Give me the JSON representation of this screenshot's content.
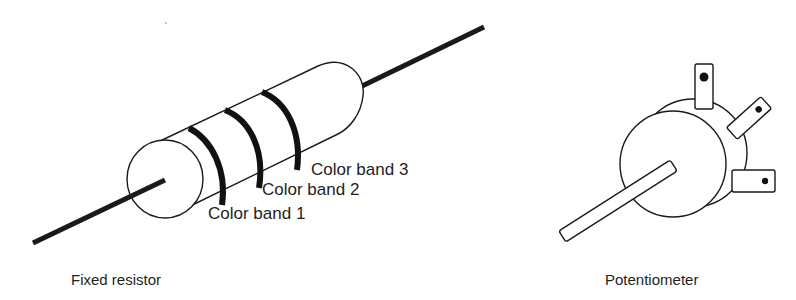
{
  "figures": [
    {
      "id": "fixed-resistor",
      "caption": "Fixed resistor",
      "labels": [
        "Color band 1",
        "Color band 2",
        "Color band 3"
      ]
    },
    {
      "id": "potentiometer",
      "caption": "Potentiometer",
      "terminals": 3
    }
  ],
  "colors": {
    "stroke": "#1a1a1a",
    "fill": "#ffffff",
    "band": "#111111"
  }
}
